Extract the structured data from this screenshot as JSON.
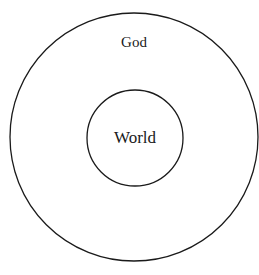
{
  "diagram": {
    "outer_circle": {
      "label": "God"
    },
    "inner_circle": {
      "label": "World"
    },
    "stroke_color": "#1a1a1a",
    "background": "#ffffff"
  }
}
